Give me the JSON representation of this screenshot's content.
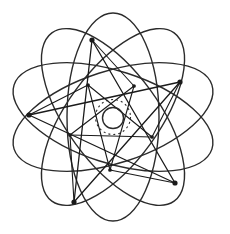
{
  "figure": {
    "kind": "line-drawing",
    "background_color": "#ffffff",
    "stroke_color": "#2b2b2b",
    "accent_stroke_color": "#1a1a1a",
    "width": 230,
    "height": 234
  },
  "chart_data": {
    "type": "scatter",
    "xlabel": "",
    "ylabel": "",
    "grid": false,
    "legend": "none",
    "xlim": [
      0,
      230
    ],
    "ylim": [
      0,
      234
    ],
    "center": {
      "x": 113,
      "y": 117
    },
    "ellipses": {
      "count": 5,
      "rx": 104,
      "ry": 46,
      "offset_x": 0,
      "offset_y": 0,
      "rotation_step_deg": 72,
      "rotations_deg": [
        18,
        90,
        162,
        234,
        306
      ],
      "stroke_width": 1.4
    },
    "inner_circle": {
      "cx": 113,
      "cy": 118,
      "r": 10.5,
      "stroke_width": 1.4,
      "dashed": false
    },
    "dotted_circle": {
      "cx": 113,
      "cy": 117,
      "r": 17.5,
      "stroke_width": 1.1,
      "dashed": true,
      "dash_pattern": "2,3"
    },
    "vertices": [
      {
        "label": "V1",
        "x": 92,
        "y": 40,
        "marker": "dot"
      },
      {
        "label": "V2",
        "x": 180,
        "y": 82,
        "marker": "dot"
      },
      {
        "label": "V3",
        "x": 175,
        "y": 183,
        "marker": "dot"
      },
      {
        "label": "V4",
        "x": 74,
        "y": 202,
        "marker": "dot"
      },
      {
        "label": "V5",
        "x": 29,
        "y": 115,
        "marker": "dot"
      }
    ],
    "inner_vertices": [
      {
        "label": "W1",
        "x": 134,
        "y": 86
      },
      {
        "label": "W2",
        "x": 152,
        "y": 137
      },
      {
        "label": "W3",
        "x": 110,
        "y": 170
      },
      {
        "label": "W4",
        "x": 70,
        "y": 135
      },
      {
        "label": "W5",
        "x": 88,
        "y": 85
      }
    ],
    "marker_radius": 2.6,
    "pentagram_edges": [
      [
        "V1",
        "V3"
      ],
      [
        "V3",
        "V5"
      ],
      [
        "V5",
        "V2"
      ],
      [
        "V2",
        "V4"
      ],
      [
        "V4",
        "V1"
      ]
    ],
    "inner_pentagram_edges": [
      [
        "W1",
        "W3"
      ],
      [
        "W3",
        "W5"
      ],
      [
        "W5",
        "W2"
      ],
      [
        "W2",
        "W4"
      ],
      [
        "W4",
        "W1"
      ]
    ],
    "spoke_edges": [
      [
        "V1",
        "W1"
      ],
      [
        "V2",
        "W2"
      ],
      [
        "V3",
        "W3"
      ],
      [
        "V4",
        "W4"
      ],
      [
        "V5",
        "W5"
      ]
    ]
  }
}
